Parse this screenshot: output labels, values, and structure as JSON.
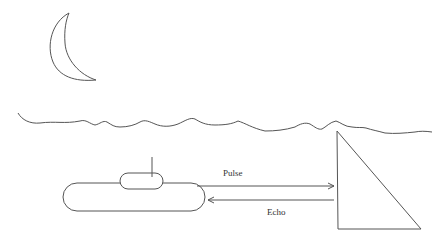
{
  "diagram": {
    "labels": {
      "pulse": "Pulse",
      "echo": "Echo"
    },
    "elements": [
      "moon",
      "water-surface",
      "submarine",
      "periscope",
      "pulse-arrow",
      "echo-arrow",
      "target-triangle"
    ],
    "stroke_color": "#555555"
  }
}
